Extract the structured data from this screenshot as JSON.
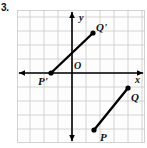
{
  "problem": {
    "number": "3."
  },
  "graph": {
    "axes": {
      "x_label": "x",
      "y_label": "y",
      "origin_label": "O"
    },
    "grid": {
      "cell_px": 14,
      "columns": 9,
      "rows": 9,
      "color": "#c9c9c9",
      "show": true
    },
    "axis_color": "#000000",
    "segment_color": "#000000",
    "points": [
      {
        "name": "P",
        "label": "P",
        "x": 77,
        "y": 120,
        "label_x": 83,
        "label_y": 122
      },
      {
        "name": "Q",
        "label": "Q",
        "x": 111,
        "y": 78,
        "label_x": 114,
        "label_y": 82
      },
      {
        "name": "P'",
        "label": "P'",
        "x": 34,
        "y": 63,
        "label_x": 21,
        "label_y": 66
      },
      {
        "name": "Q'",
        "label": "Q'",
        "x": 76,
        "y": 23,
        "label_x": 79,
        "label_y": 12
      }
    ],
    "segments": [
      {
        "name": "segment-PQ",
        "from": "P",
        "to": "Q"
      },
      {
        "name": "segment-PpQp",
        "from": "P'",
        "to": "Q'"
      }
    ]
  },
  "chart_data": {
    "type": "scatter",
    "title": "",
    "xlabel": "x",
    "ylabel": "y",
    "grid": true,
    "legend": null,
    "unit_px": 14,
    "origin_px": {
      "x": 55,
      "y": 63
    },
    "series": [
      {
        "name": "segment PQ",
        "points": [
          {
            "label": "P",
            "x": 1.5,
            "y": -4
          },
          {
            "label": "Q",
            "x": 4,
            "y": -1
          }
        ]
      },
      {
        "name": "segment P'Q'",
        "points": [
          {
            "label": "P'",
            "x": -1.5,
            "y": 0
          },
          {
            "label": "Q'",
            "x": 1.5,
            "y": 3
          }
        ]
      }
    ],
    "xlim": [
      -4,
      5.5
    ],
    "ylim": [
      -5,
      4.5
    ]
  }
}
